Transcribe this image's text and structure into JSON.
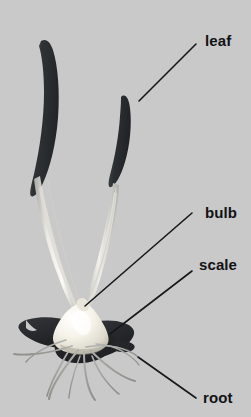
{
  "figure": {
    "background_color": "#c9c9c9",
    "width": 251,
    "height": 417
  },
  "labels": [
    {
      "id": "leaf",
      "text": "leaf",
      "color": "#111316",
      "x": 205,
      "y": 33,
      "leader_line": {
        "x1": 196,
        "y1": 44,
        "x2": 139,
        "y2": 101
      }
    },
    {
      "id": "bulb",
      "text": "bulb",
      "color": "#111316",
      "x": 205,
      "y": 205,
      "leader_line": {
        "x1": 192,
        "y1": 213,
        "x2": 85,
        "y2": 306
      }
    },
    {
      "id": "scale",
      "text": "scale",
      "color": "#111316",
      "x": 199,
      "y": 257,
      "leader_line": {
        "x1": 192,
        "y1": 271,
        "x2": 110,
        "y2": 334
      }
    },
    {
      "id": "root",
      "text": "root",
      "color": "#111316",
      "x": 203,
      "y": 390,
      "leader_line": {
        "x1": 138,
        "y1": 357,
        "x2": 196,
        "y2": 398
      }
    }
  ],
  "plant": {
    "parts": [
      {
        "name": "leaf",
        "description": "two long dark curved blade leaves",
        "color": "#2f3134"
      },
      {
        "name": "stem",
        "description": "pale slender stems rising from bulb",
        "color": "#d7d6d2"
      },
      {
        "name": "bulb",
        "description": "cream white teardrop storage bulb",
        "color": "#f2efe6"
      },
      {
        "name": "scale",
        "description": "dark fleshy scale leaves at bulb base",
        "color": "#27292b"
      },
      {
        "name": "root",
        "description": "thin grey fibrous roots",
        "color": "#9a9a97"
      }
    ]
  },
  "style": {
    "leader_line_color": "#16181a",
    "leader_line_width": 1.6
  }
}
